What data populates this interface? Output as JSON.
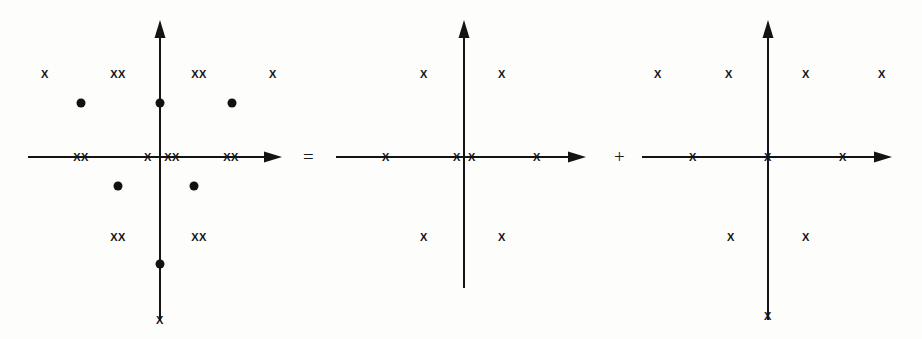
{
  "figure": {
    "background_color": "#fdfdfc",
    "ink_color": "#141414",
    "operators": [
      {
        "symbol": "=",
        "name": "equals-operator",
        "x": 303,
        "y": 157
      },
      {
        "symbol": "+",
        "name": "plus-operator",
        "x": 614,
        "y": 157
      }
    ]
  },
  "chart_data": {
    "type": "scatter",
    "xlabel": "",
    "ylabel": "",
    "grid": false,
    "legend": "none",
    "panels": [
      {
        "name": "combined-diagram",
        "label": "combined",
        "origin": {
          "x": 160,
          "y": 157
        },
        "x_axis": {
          "start_x": 28,
          "end_x": 282,
          "arrow": "right"
        },
        "y_axis": {
          "start_y": 20,
          "end_y": 320,
          "arrow": "up"
        },
        "markers": [
          {
            "glyph": "X",
            "x": 45,
            "y": 74,
            "size": 11
          },
          {
            "glyph": "XX",
            "x": 118,
            "y": 74,
            "size": 11
          },
          {
            "glyph": "XX",
            "x": 199,
            "y": 74,
            "size": 11
          },
          {
            "glyph": "X",
            "x": 273,
            "y": 74,
            "size": 11
          },
          {
            "glyph": "XX",
            "x": 81,
            "y": 157,
            "size": 11
          },
          {
            "glyph": "X",
            "x": 148,
            "y": 157,
            "size": 11
          },
          {
            "glyph": "XX",
            "x": 172,
            "y": 157,
            "size": 11
          },
          {
            "glyph": "XX",
            "x": 231,
            "y": 157,
            "size": 11
          },
          {
            "glyph": "XX",
            "x": 118,
            "y": 237,
            "size": 11
          },
          {
            "glyph": "XX",
            "x": 199,
            "y": 237,
            "size": 11
          },
          {
            "glyph": "X",
            "x": 160,
            "y": 320,
            "size": 11
          }
        ],
        "dots": [
          {
            "x": 81,
            "y": 103,
            "r": 4.5
          },
          {
            "x": 160,
            "y": 103,
            "r": 4.5
          },
          {
            "x": 232,
            "y": 103,
            "r": 4.5
          },
          {
            "x": 118,
            "y": 186,
            "r": 4.5
          },
          {
            "x": 194,
            "y": 186,
            "r": 4.5
          },
          {
            "x": 160,
            "y": 264,
            "r": 4.5
          }
        ]
      },
      {
        "name": "first-component-diagram",
        "label": "first component",
        "origin": {
          "x": 464,
          "y": 157
        },
        "x_axis": {
          "start_x": 336,
          "end_x": 586,
          "arrow": "right"
        },
        "y_axis": {
          "start_y": 20,
          "end_y": 288,
          "arrow": "up"
        },
        "markers": [
          {
            "glyph": "X",
            "x": 424,
            "y": 74,
            "size": 11
          },
          {
            "glyph": "X",
            "x": 502,
            "y": 74,
            "size": 11
          },
          {
            "glyph": "X",
            "x": 386,
            "y": 157,
            "size": 11
          },
          {
            "glyph": "X",
            "x": 457,
            "y": 157,
            "size": 11
          },
          {
            "glyph": "X",
            "x": 472,
            "y": 157,
            "size": 11
          },
          {
            "glyph": "X",
            "x": 537,
            "y": 157,
            "size": 11
          },
          {
            "glyph": "X",
            "x": 424,
            "y": 237,
            "size": 11
          },
          {
            "glyph": "X",
            "x": 502,
            "y": 237,
            "size": 11
          }
        ],
        "dots": []
      },
      {
        "name": "second-component-diagram",
        "label": "second component",
        "origin": {
          "x": 768,
          "y": 157
        },
        "x_axis": {
          "start_x": 642,
          "end_x": 892,
          "arrow": "right"
        },
        "y_axis": {
          "start_y": 20,
          "end_y": 320,
          "arrow": "up"
        },
        "markers": [
          {
            "glyph": "X",
            "x": 658,
            "y": 74,
            "size": 11
          },
          {
            "glyph": "X",
            "x": 729,
            "y": 74,
            "size": 11
          },
          {
            "glyph": "X",
            "x": 806,
            "y": 74,
            "size": 11
          },
          {
            "glyph": "X",
            "x": 882,
            "y": 74,
            "size": 11
          },
          {
            "glyph": "X",
            "x": 693,
            "y": 157,
            "size": 11
          },
          {
            "glyph": "X",
            "x": 768,
            "y": 157,
            "size": 11
          },
          {
            "glyph": "X",
            "x": 843,
            "y": 157,
            "size": 11
          },
          {
            "glyph": "X",
            "x": 731,
            "y": 237,
            "size": 11
          },
          {
            "glyph": "X",
            "x": 806,
            "y": 237,
            "size": 11
          },
          {
            "glyph": "X",
            "x": 768,
            "y": 316,
            "size": 11
          }
        ],
        "dots": []
      }
    ]
  }
}
